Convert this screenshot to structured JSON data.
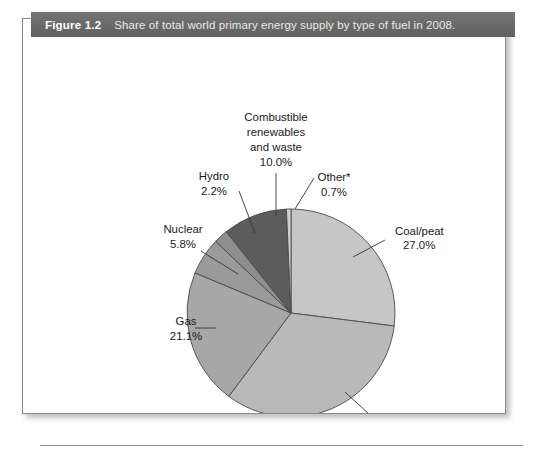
{
  "figure": {
    "number_label": "Figure 1.2",
    "caption": "Share of total world primary energy supply by type of fuel in 2008."
  },
  "chart_data": {
    "type": "pie",
    "title": "Share of total world primary energy supply by type of fuel in 2008.",
    "unit": "%",
    "legend": "none",
    "grid": false,
    "categories": [
      "Coal/peat",
      "Oil",
      "Gas",
      "Nuclear",
      "Hydro",
      "Combustible renewables and waste",
      "Other*"
    ],
    "values": [
      27.0,
      33.2,
      21.1,
      5.8,
      2.2,
      10.0,
      0.7
    ],
    "colors": [
      "#c6c6c6",
      "#b9b9b9",
      "#a7a7a7",
      "#9a9a9a",
      "#8e8e8e",
      "#5c5c5c",
      "#d2d2d2"
    ],
    "start_angle_deg": 0,
    "direction": "clockwise",
    "slices": [
      {
        "name": "Coal/peat",
        "label": "Coal/peat",
        "value_label": "27.0%",
        "value": 27.0,
        "color": "#c6c6c6",
        "label_x": 372,
        "label_y": 194,
        "value_x": 380,
        "value_y": 208,
        "anchor": "start",
        "leader": [
          330,
          216,
          362,
          199
        ]
      },
      {
        "name": "Oil",
        "label": "Oil",
        "value_label": "33.2%",
        "value": 33.2,
        "color": "#b9b9b9",
        "label_x": 352,
        "label_y": 383,
        "value_x": 352,
        "value_y": 398,
        "anchor": "middle",
        "leader": [
          322,
          351,
          347,
          374
        ]
      },
      {
        "name": "Gas",
        "label": "Gas",
        "value_label": "21.1%",
        "value": 21.1,
        "color": "#a7a7a7",
        "label_x": 163,
        "label_y": 284,
        "value_x": 163,
        "value_y": 299,
        "anchor": "middle",
        "leader": [
          172,
          287,
          193,
          287
        ]
      },
      {
        "name": "Nuclear",
        "label": "Nuclear",
        "value_label": "5.8%",
        "value": 5.8,
        "color": "#9a9a9a",
        "label_x": 160,
        "label_y": 192,
        "value_x": 160,
        "value_y": 207,
        "anchor": "middle",
        "leader": [
          178,
          210,
          215,
          233
        ]
      },
      {
        "name": "Hydro",
        "label": "Hydro",
        "value_label": "2.2%",
        "value": 2.2,
        "color": "#8e8e8e",
        "label_x": 191,
        "label_y": 139,
        "value_x": 191,
        "value_y": 154,
        "anchor": "middle",
        "leader": [
          216,
          150,
          232,
          192
        ]
      },
      {
        "name": "Combustible renewables and waste",
        "label_line1": "Combustible",
        "label_line2": "renewables",
        "label_line3": "and waste",
        "value_label": "10.0%",
        "value": 10.0,
        "color": "#5c5c5c",
        "label_x": 253,
        "label_y": 80,
        "anchor": "middle",
        "leader": [
          253,
          132,
          253,
          175
        ]
      },
      {
        "name": "Other*",
        "label": "Other*",
        "value_label": "0.7%",
        "value": 0.7,
        "color": "#d2d2d2",
        "label_x": 311,
        "label_y": 140,
        "value_x": 311,
        "value_y": 155,
        "anchor": "middle",
        "leader": [
          291,
          137,
          272,
          168
        ]
      }
    ],
    "geometry": {
      "cx": 268,
      "cy": 272,
      "r": 104
    }
  }
}
